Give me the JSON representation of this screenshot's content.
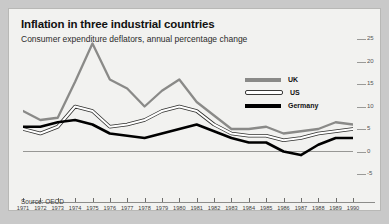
{
  "figure": {
    "title": "Inflation in three industrial countries",
    "subtitle": "Consumer expenditure deflators, annual percentage change",
    "source": "Source: OECD"
  },
  "legend": {
    "items": [
      {
        "label": "UK",
        "color": "#8a8a88",
        "style": "solid-grey"
      },
      {
        "label": "US",
        "color": "#ffffff",
        "style": "hollow-outline"
      },
      {
        "label": "Germany",
        "color": "#000000",
        "style": "solid-black"
      }
    ]
  },
  "chart_data": {
    "type": "line",
    "title": "Inflation in three industrial countries",
    "subtitle": "Consumer expenditure deflators, annual percentage change",
    "xlabel": "",
    "ylabel": "annual percentage change",
    "ylim": [
      -5,
      25
    ],
    "yticks": [
      -5,
      0,
      5,
      10,
      15,
      20,
      25
    ],
    "ytick_labels": [
      "-5",
      "0",
      "5",
      "10",
      "15",
      "20",
      "25"
    ],
    "ytick_side": "right",
    "grid": false,
    "zero_line": true,
    "legend_position": "upper-right-inside",
    "x": [
      1971,
      1972,
      1973,
      1974,
      1975,
      1976,
      1977,
      1978,
      1979,
      1980,
      1981,
      1982,
      1983,
      1984,
      1985,
      1986,
      1987,
      1988,
      1989,
      1990
    ],
    "xtick_labels": [
      "1971",
      "1972",
      "1973",
      "1974",
      "1975",
      "1976",
      "1977",
      "1978",
      "1979",
      "1980",
      "1981",
      "1982",
      "1983",
      "1984",
      "1985",
      "1986",
      "1987",
      "1988",
      "1989",
      "1990"
    ],
    "series": [
      {
        "name": "UK",
        "color": "#8a8a88",
        "values": [
          9.0,
          7.0,
          7.5,
          15.5,
          24.0,
          16.0,
          14.0,
          10.0,
          13.5,
          16.0,
          11.0,
          8.0,
          5.0,
          5.0,
          5.5,
          4.0,
          4.5,
          5.0,
          6.5,
          6.0
        ]
      },
      {
        "name": "US",
        "color": "#ffffff",
        "values": [
          5.0,
          4.0,
          5.5,
          10.0,
          9.0,
          5.5,
          6.0,
          7.0,
          9.0,
          10.0,
          9.0,
          6.0,
          4.0,
          3.5,
          3.5,
          2.5,
          3.0,
          4.0,
          4.5,
          5.0
        ]
      },
      {
        "name": "Germany",
        "color": "#000000",
        "values": [
          5.5,
          5.5,
          6.5,
          7.0,
          6.0,
          4.0,
          3.5,
          3.0,
          4.0,
          5.0,
          6.0,
          4.5,
          3.0,
          2.0,
          2.0,
          0.0,
          -0.8,
          1.5,
          3.0,
          3.0
        ]
      }
    ]
  }
}
